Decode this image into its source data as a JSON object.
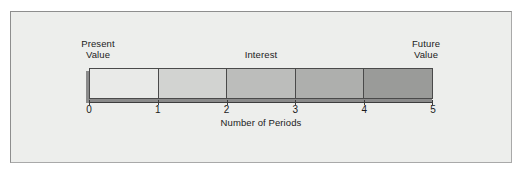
{
  "figure": {
    "background_color": "#edeeec",
    "border_color": "#8e8e8e",
    "annotations": {
      "present_value": "Present\nValue",
      "interest": "Interest",
      "future_value": "Future\nValue"
    },
    "axis_title": "Number of Periods"
  },
  "chart_data": {
    "type": "bar",
    "title": "",
    "subtitle": "",
    "xlabel": "Number of Periods",
    "ylabel": "",
    "orientation": "horizontal",
    "grid": false,
    "legend": "none",
    "xlim": [
      0,
      5
    ],
    "categories": [
      "0-1",
      "1-2",
      "2-3",
      "3-4",
      "4-5"
    ],
    "tick_labels": [
      "0",
      "1",
      "2",
      "3",
      "4",
      "5"
    ],
    "tick_values": [
      0,
      1,
      2,
      3,
      4,
      5
    ],
    "values": [
      1,
      1,
      1,
      1,
      1
    ],
    "segment_colors": [
      "#e9eae8",
      "#d2d3d1",
      "#bcbdbb",
      "#aeafad",
      "#9a9b99"
    ],
    "segment_border_color": "#4a4a4a",
    "shadow_color": "#8a8a8a",
    "annotations": [
      {
        "text": "Present\nValue",
        "at": "left-end",
        "x": 0
      },
      {
        "text": "Interest",
        "at": "center-above",
        "x": 2.5
      },
      {
        "text": "Future\nValue",
        "at": "right-end",
        "x": 5
      }
    ]
  }
}
